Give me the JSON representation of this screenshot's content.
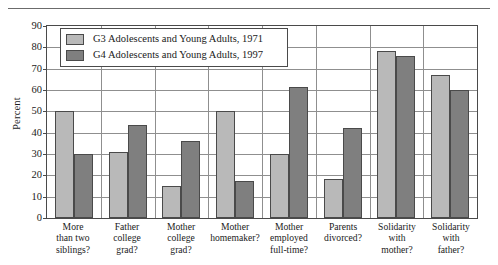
{
  "chart_data": {
    "type": "bar",
    "title": "",
    "xlabel": "",
    "ylabel": "Percent",
    "ylim": [
      0,
      90
    ],
    "ytick_step": 10,
    "yticks": [
      0,
      10,
      20,
      30,
      40,
      50,
      60,
      70,
      80,
      90
    ],
    "grid": true,
    "legend_position": "top-left-inside",
    "categories": [
      "More than two siblings?",
      "Father college grad?",
      "Mother college grad?",
      "Mother homemaker?",
      "Mother employed full-time?",
      "Parents divorced?",
      "Solidarity with mother?",
      "Solidarity with father?"
    ],
    "category_lines": [
      [
        "More",
        "than two",
        "siblings?"
      ],
      [
        "Father",
        "college",
        "grad?"
      ],
      [
        "Mother",
        "college",
        "grad?"
      ],
      [
        "Mother",
        "homemaker?"
      ],
      [
        "Mother",
        "employed",
        "full-time?"
      ],
      [
        "Parents",
        "divorced?"
      ],
      [
        "Solidarity",
        "with",
        "mother?"
      ],
      [
        "Solidarity",
        "with",
        "father?"
      ]
    ],
    "series": [
      {
        "name": "G3 Adolescents and Young Adults, 1971",
        "color": "#b9b9b9",
        "values": [
          50,
          31,
          15,
          50,
          30,
          18.5,
          78.5,
          67
        ]
      },
      {
        "name": "G4 Adolescents and Young Adults, 1997",
        "color": "#7f7f7f",
        "values": [
          30,
          43.5,
          36,
          17.5,
          61.5,
          42,
          76,
          60
        ]
      }
    ]
  },
  "legend": {
    "items": [
      {
        "label": "G3 Adolescents and Young Adults, 1971"
      },
      {
        "label": "G4 Adolescents and Young Adults, 1997"
      }
    ]
  },
  "axis": {
    "y_title": "Percent"
  }
}
